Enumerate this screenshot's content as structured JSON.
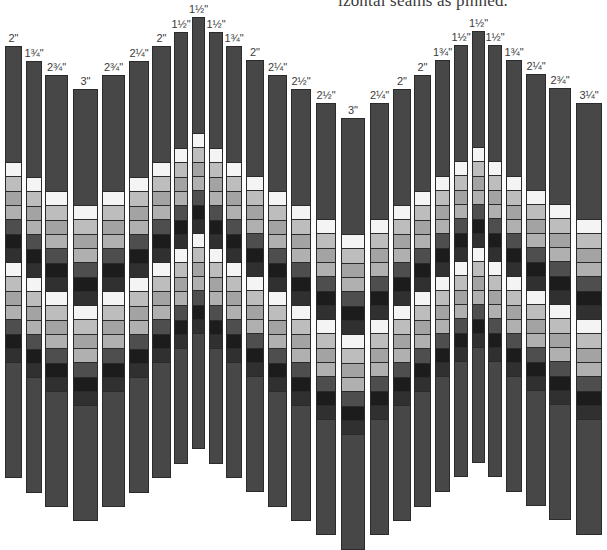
{
  "caption": "izontal seams as pinned.",
  "colors": {
    "strip_body": "#474747",
    "strip_border": "#2b2b2b",
    "band_sequence": [
      "#f4f4f4",
      "#bdbdbd",
      "#a3a3a3",
      "#b0b0b0",
      "#4e4e4e",
      "#1c1c1c",
      "#303030",
      "#f4f4f4",
      "#bdbdbd",
      "#a3a3a3",
      "#b0b0b0",
      "#4e4e4e",
      "#1c1c1c",
      "#303030"
    ]
  },
  "band": {
    "offset_from_top": 116,
    "segment_height": 14.3,
    "segment_count": 14
  },
  "strip_height": 432,
  "strips": [
    {
      "label": "2\"",
      "x": 5,
      "w": 17,
      "top": 46
    },
    {
      "label": "1¾\"",
      "x": 26,
      "w": 16,
      "top": 61
    },
    {
      "label": "2¾\"",
      "x": 45,
      "w": 23,
      "top": 75
    },
    {
      "label": "3\"",
      "x": 73,
      "w": 25,
      "top": 89
    },
    {
      "label": "2¾\"",
      "x": 102,
      "w": 23,
      "top": 75
    },
    {
      "label": "2¼\"",
      "x": 129,
      "w": 20,
      "top": 61
    },
    {
      "label": "2\"",
      "x": 152,
      "w": 19,
      "top": 46
    },
    {
      "label": "1½\"",
      "x": 174,
      "w": 14,
      "top": 32
    },
    {
      "label": "1½\"",
      "x": 192,
      "w": 13,
      "top": 17
    },
    {
      "label": "1½\"",
      "x": 209,
      "w": 14,
      "top": 32
    },
    {
      "label": "1¾\"",
      "x": 226,
      "w": 16,
      "top": 46
    },
    {
      "label": "2\"",
      "x": 246,
      "w": 18,
      "top": 60
    },
    {
      "label": "2¼\"",
      "x": 268,
      "w": 19,
      "top": 75
    },
    {
      "label": "2½\"",
      "x": 291,
      "w": 20,
      "top": 89
    },
    {
      "label": "2½\"",
      "x": 316,
      "w": 20,
      "top": 103
    },
    {
      "label": "3\"",
      "x": 341,
      "w": 24,
      "top": 118
    },
    {
      "label": "2¼\"",
      "x": 370,
      "w": 19,
      "top": 103
    },
    {
      "label": "2\"",
      "x": 393,
      "w": 18,
      "top": 89
    },
    {
      "label": "2\"",
      "x": 414,
      "w": 17,
      "top": 75
    },
    {
      "label": "1¾\"",
      "x": 435,
      "w": 15,
      "top": 60
    },
    {
      "label": "1½\"",
      "x": 454,
      "w": 14,
      "top": 45
    },
    {
      "label": "1½\"",
      "x": 472,
      "w": 13,
      "top": 31
    },
    {
      "label": "1½\"",
      "x": 488,
      "w": 14,
      "top": 45
    },
    {
      "label": "1¾\"",
      "x": 506,
      "w": 16,
      "top": 60
    },
    {
      "label": "2¼\"",
      "x": 526,
      "w": 20,
      "top": 74
    },
    {
      "label": "2¾\"",
      "x": 549,
      "w": 22,
      "top": 88
    },
    {
      "label": "3¼\"",
      "x": 576,
      "w": 26,
      "top": 103
    }
  ]
}
